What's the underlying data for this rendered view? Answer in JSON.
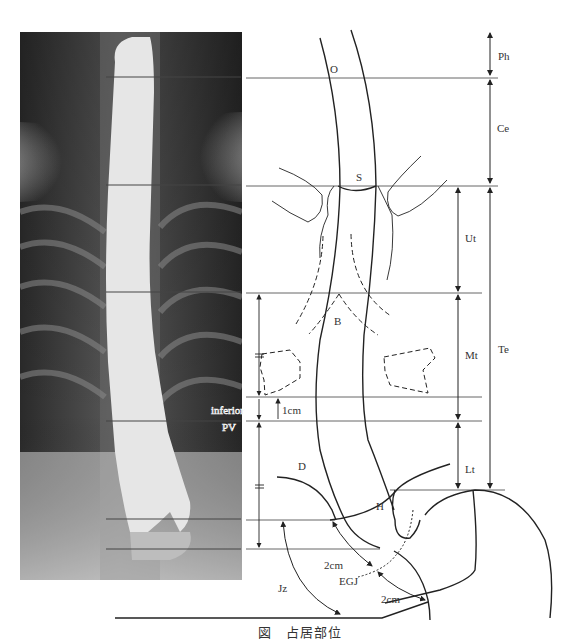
{
  "figure": {
    "caption_prefix": "図",
    "caption_title": "占居部位",
    "xray_label": "esophagram-xray",
    "labels": {
      "O": "O",
      "S": "S",
      "B": "B",
      "D": "D",
      "H": "H",
      "EGJ": "EGJ",
      "Jz": "Jz",
      "inferior": "inferior",
      "PV": "PV",
      "one_cm": "1cm",
      "two_cm_upper": "2cm",
      "two_cm_lower": "2cm"
    },
    "regions_outer": [
      {
        "code": "Ph",
        "meaning": "pharynx"
      },
      {
        "code": "Ce",
        "meaning": "cervical esophagus"
      },
      {
        "code": "Te",
        "meaning": "thoracic esophagus"
      }
    ],
    "regions_inner": [
      {
        "code": "Ut",
        "meaning": "upper thoracic"
      },
      {
        "code": "Mt",
        "meaning": "middle thoracic"
      },
      {
        "code": "Lt",
        "meaning": "lower thoracic"
      }
    ]
  }
}
